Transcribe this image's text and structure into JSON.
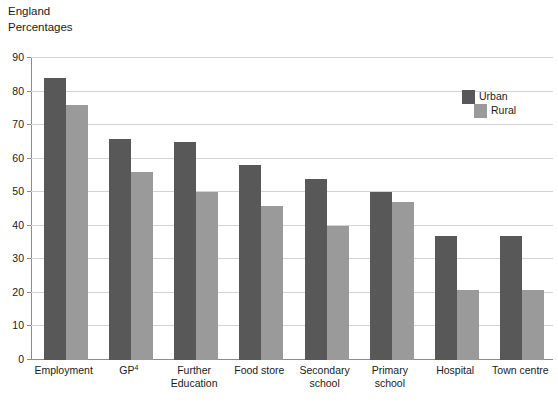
{
  "header": {
    "region": "England",
    "units": "Percentages"
  },
  "legend": {
    "position": "top-right",
    "items": [
      {
        "label": "Urban",
        "color": "#585858",
        "key": "urban"
      },
      {
        "label": "Rural",
        "color": "#9a9a9a",
        "key": "rural"
      }
    ]
  },
  "axis": {
    "y_ticks": [
      "0",
      "10",
      "20",
      "30",
      "40",
      "50",
      "60",
      "70",
      "80",
      "90"
    ]
  },
  "chart_data": {
    "type": "bar",
    "title": "England",
    "subtitle": "Percentages",
    "xlabel": "",
    "ylabel": "Percentages",
    "ylim": [
      0,
      90
    ],
    "ytick_step": 10,
    "grid": true,
    "legend_position": "top-right",
    "categories": [
      "Employment",
      "GP4",
      "Further Education",
      "Food store",
      "Secondary school",
      "Primary school",
      "Hospital",
      "Town centre"
    ],
    "category_labels": [
      {
        "line1": "Employment",
        "line2": "",
        "footnote": ""
      },
      {
        "line1": "GP",
        "line2": "",
        "footnote": "4"
      },
      {
        "line1": "Further",
        "line2": "Education",
        "footnote": ""
      },
      {
        "line1": "Food store",
        "line2": "",
        "footnote": ""
      },
      {
        "line1": "Secondary",
        "line2": "school",
        "footnote": ""
      },
      {
        "line1": "Primary",
        "line2": "school",
        "footnote": ""
      },
      {
        "line1": "Hospital",
        "line2": "",
        "footnote": ""
      },
      {
        "line1": "Town centre",
        "line2": "",
        "footnote": ""
      }
    ],
    "series": [
      {
        "name": "Urban",
        "color": "#585858",
        "values": [
          84,
          66,
          65,
          58,
          54,
          50,
          37,
          37
        ]
      },
      {
        "name": "Rural",
        "color": "#9a9a9a",
        "values": [
          76,
          56,
          50,
          46,
          40,
          47,
          21,
          21
        ]
      }
    ]
  }
}
